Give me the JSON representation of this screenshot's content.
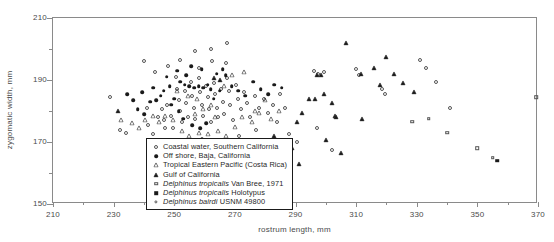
{
  "chart_data": {
    "type": "scatter",
    "title": "",
    "xlabel": "rostrum length, mm",
    "ylabel": "zygomatic width, mm",
    "xlim": [
      210,
      370
    ],
    "ylim": [
      150,
      210
    ],
    "xticks": [
      210,
      230,
      250,
      270,
      290,
      310,
      330,
      350,
      370
    ],
    "xtick_labels": [
      "210",
      "230",
      "250",
      "270",
      "290",
      "310",
      "330",
      "350",
      "370"
    ],
    "xminor_step": 10,
    "yticks": [
      150,
      170,
      190,
      210
    ],
    "ytick_labels": [
      "150",
      "170",
      "190",
      "210"
    ],
    "yminor": [
      160,
      180,
      200
    ],
    "grid": false,
    "legend_position": "lower-center-left",
    "series": [
      {
        "name": "Coastal water, Southern California",
        "marker": "circle-open",
        "points": [
          [
            228.8,
            184.5
          ],
          [
            244.5,
            178.0
          ],
          [
            246.5,
            177.0
          ],
          [
            247.0,
            174.5
          ],
          [
            246.0,
            180.5
          ],
          [
            247.5,
            181.8
          ],
          [
            249.0,
            178.5
          ],
          [
            249.5,
            174.5
          ],
          [
            250.5,
            191.0
          ],
          [
            250.8,
            187.2
          ],
          [
            251.5,
            183.5
          ],
          [
            252.0,
            180.0
          ],
          [
            252.5,
            176.5
          ],
          [
            253.5,
            186.5
          ],
          [
            254.0,
            182.5
          ],
          [
            254.5,
            178.0
          ],
          [
            255.5,
            189.5
          ],
          [
            256.0,
            185.0
          ],
          [
            256.5,
            181.0
          ],
          [
            257.0,
            177.5
          ],
          [
            258.0,
            190.5
          ],
          [
            258.5,
            186.0
          ],
          [
            259.0,
            182.0
          ],
          [
            259.5,
            178.5
          ],
          [
            260.5,
            188.0
          ],
          [
            261.0,
            184.5
          ],
          [
            261.5,
            180.5
          ],
          [
            262.0,
            176.5
          ],
          [
            263.0,
            189.0
          ],
          [
            263.5,
            185.5
          ],
          [
            264.0,
            181.0
          ],
          [
            264.5,
            178.0
          ],
          [
            265.5,
            187.0
          ],
          [
            266.0,
            183.0
          ],
          [
            266.5,
            179.0
          ],
          [
            267.5,
            190.5
          ],
          [
            268.0,
            186.5
          ],
          [
            268.5,
            182.0
          ],
          [
            269.5,
            177.0
          ],
          [
            270.5,
            188.5
          ],
          [
            271.0,
            184.0
          ],
          [
            272.0,
            180.5
          ],
          [
            273.0,
            186.0
          ],
          [
            274.0,
            182.5
          ],
          [
            275.0,
            178.0
          ],
          [
            276.5,
            185.0
          ],
          [
            278.0,
            181.0
          ],
          [
            279.5,
            184.0
          ],
          [
            281.0,
            179.5
          ],
          [
            282.5,
            182.0
          ],
          [
            284.0,
            176.5
          ],
          [
            285.0,
            185.5
          ],
          [
            286.5,
            181.0
          ],
          [
            288.0,
            172.5
          ],
          [
            290.5,
            170.0
          ],
          [
            296.0,
            193.0
          ],
          [
            297.5,
            192.0
          ],
          [
            299.5,
            192.5
          ],
          [
            297.0,
            174.5
          ],
          [
            302.0,
            167.5
          ],
          [
            310.0,
            193.5
          ],
          [
            311.0,
            191.5
          ],
          [
            318.5,
            187.0
          ],
          [
            319.5,
            185.5
          ],
          [
            331.0,
            196.5
          ],
          [
            333.0,
            194.0
          ],
          [
            336.5,
            189.5
          ],
          [
            341.0,
            181.0
          ],
          [
            253.0,
            170.5
          ],
          [
            259.0,
            171.0
          ],
          [
            265.0,
            170.5
          ],
          [
            271.5,
            172.0
          ],
          [
            277.0,
            174.0
          ],
          [
            241.0,
            181.0
          ],
          [
            241.5,
            175.5
          ],
          [
            243.0,
            172.5
          ],
          [
            232.0,
            174.0
          ],
          [
            234.0,
            173.0
          ],
          [
            240.0,
            196.0
          ],
          [
            243.5,
            192.5
          ],
          [
            248.0,
            194.5
          ],
          [
            252.0,
            196.5
          ],
          [
            258.0,
            194.0
          ],
          [
            262.5,
            196.0
          ],
          [
            267.0,
            195.5
          ],
          [
            262.0,
            200.0
          ],
          [
            267.5,
            202.0
          ],
          [
            257.0,
            199.5
          ]
        ]
      },
      {
        "name": "Off shore, Baja, California",
        "marker": "circle-filled",
        "points": [
          [
            239.5,
            186.0
          ],
          [
            244.0,
            183.5
          ],
          [
            248.5,
            188.0
          ],
          [
            250.0,
            184.0
          ],
          [
            252.0,
            189.5
          ],
          [
            253.5,
            188.5
          ],
          [
            255.0,
            188.0
          ],
          [
            256.5,
            187.5
          ],
          [
            258.0,
            188.0
          ],
          [
            259.5,
            187.5
          ],
          [
            261.0,
            188.5
          ],
          [
            262.0,
            187.0
          ],
          [
            254.0,
            191.5
          ],
          [
            251.0,
            193.0
          ],
          [
            247.5,
            191.0
          ],
          [
            245.5,
            185.0
          ],
          [
            249.0,
            182.0
          ],
          [
            251.5,
            180.0
          ],
          [
            253.0,
            177.5
          ],
          [
            256.0,
            175.5
          ],
          [
            258.5,
            174.5
          ],
          [
            260.5,
            176.0
          ],
          [
            263.0,
            184.0
          ],
          [
            265.0,
            186.5
          ],
          [
            267.0,
            191.5
          ],
          [
            269.0,
            188.0
          ],
          [
            271.0,
            186.5
          ],
          [
            273.5,
            185.0
          ],
          [
            276.0,
            189.5
          ],
          [
            278.5,
            187.0
          ],
          [
            281.0,
            185.5
          ],
          [
            283.0,
            188.5
          ],
          [
            285.5,
            187.5
          ],
          [
            246.5,
            186.5
          ],
          [
            243.0,
            187.5
          ],
          [
            242.0,
            183.0
          ],
          [
            240.0,
            179.0
          ],
          [
            238.0,
            180.5
          ],
          [
            236.5,
            183.5
          ],
          [
            234.5,
            185.5
          ],
          [
            264.0,
            192.0
          ],
          [
            266.0,
            193.5
          ],
          [
            259.0,
            193.5
          ],
          [
            255.5,
            194.5
          ]
        ]
      },
      {
        "name": "Tropical Eastern Pacific (Costa Rica)",
        "marker": "triangle-open",
        "points": [
          [
            232.5,
            177.0
          ],
          [
            236.0,
            176.0
          ],
          [
            245.0,
            176.5
          ],
          [
            247.0,
            178.5
          ],
          [
            249.5,
            177.0
          ],
          [
            252.5,
            173.5
          ],
          [
            255.0,
            172.0
          ],
          [
            258.0,
            173.0
          ],
          [
            261.0,
            172.5
          ],
          [
            264.5,
            173.5
          ],
          [
            267.0,
            172.0
          ],
          [
            270.0,
            175.0
          ],
          [
            272.5,
            178.0
          ],
          [
            275.5,
            176.5
          ],
          [
            278.0,
            179.5
          ],
          [
            251.0,
            186.5
          ],
          [
            254.5,
            185.0
          ],
          [
            257.5,
            184.0
          ],
          [
            262.0,
            182.0
          ],
          [
            266.5,
            188.0
          ],
          [
            269.0,
            191.5
          ],
          [
            273.0,
            192.5
          ],
          [
            276.5,
            180.0
          ],
          [
            280.0,
            183.5
          ],
          [
            282.0,
            177.5
          ],
          [
            284.5,
            180.0
          ],
          [
            243.0,
            178.5
          ],
          [
            240.5,
            177.0
          ],
          [
            238.5,
            174.5
          ],
          [
            259.5,
            180.5
          ],
          [
            263.5,
            178.0
          ],
          [
            257.0,
            179.0
          ]
        ]
      },
      {
        "name": "Gulf of California",
        "marker": "triangle-filled",
        "points": [
          [
            231.5,
            180.0
          ],
          [
            263.0,
            190.5
          ],
          [
            265.0,
            190.0
          ],
          [
            283.0,
            172.0
          ],
          [
            289.0,
            168.0
          ],
          [
            290.5,
            176.5
          ],
          [
            294.5,
            184.0
          ],
          [
            296.5,
            184.0
          ],
          [
            297.0,
            191.5
          ],
          [
            298.5,
            191.5
          ],
          [
            299.5,
            185.5
          ],
          [
            302.0,
            182.5
          ],
          [
            303.0,
            178.5
          ],
          [
            303.5,
            178.0
          ],
          [
            306.5,
            202.0
          ],
          [
            311.5,
            192.0
          ],
          [
            312.0,
            177.5
          ],
          [
            316.0,
            194.0
          ],
          [
            318.0,
            188.5
          ],
          [
            320.0,
            197.5
          ],
          [
            322.5,
            192.0
          ],
          [
            325.5,
            189.0
          ],
          [
            329.0,
            186.0
          ],
          [
            291.0,
            163.0
          ],
          [
            292.0,
            179.5
          ],
          [
            305.0,
            166.5
          ],
          [
            300.0,
            170.5
          ]
        ]
      },
      {
        "name": "Delphinus tropicalis Van Bree, 1971",
        "marker": "square-open",
        "italic_prefix": "Delphinus tropicalis",
        "points": [
          [
            328.5,
            176.5
          ],
          [
            334.0,
            177.5
          ],
          [
            340.0,
            173.0
          ],
          [
            350.0,
            168.0
          ],
          [
            355.0,
            165.0
          ],
          [
            369.5,
            184.5
          ]
        ]
      },
      {
        "name": "Delphinus tropicalis Holotypus",
        "marker": "square-filled",
        "italic_prefix": "Delphinus tropicalis",
        "points": [
          [
            356.5,
            164.0
          ]
        ]
      },
      {
        "name": "Delphinus bairdi USNM 49800",
        "marker": "circle-open-small",
        "italic_prefix": "Delphinus bairdi",
        "points": [
          [
            247.0,
            169.5
          ]
        ]
      }
    ]
  },
  "legend": {
    "items": [
      {
        "symbol": "circle-open",
        "text": "Coastal water, Southern California"
      },
      {
        "symbol": "circle-filled",
        "text": "Off shore, Baja, California"
      },
      {
        "symbol": "triangle-open",
        "text": "Tropical Eastern Pacific (Costa Rica)"
      },
      {
        "symbol": "triangle-filled",
        "text": "Gulf of California"
      },
      {
        "symbol": "square-open",
        "text": "Delphinus tropicalis Van Bree, 1971"
      },
      {
        "symbol": "square-filled",
        "text": "Delphinus tropicalis Holotypus"
      },
      {
        "symbol": "circle-open-small",
        "text": "Delphinus bairdi USNM 49800"
      }
    ]
  },
  "colors": {
    "frame": "#8a8a8a",
    "marker": "#1a1a1a",
    "text": "#3a3a3a",
    "legend_border": "#1a1a1a",
    "background": "#ffffff"
  }
}
